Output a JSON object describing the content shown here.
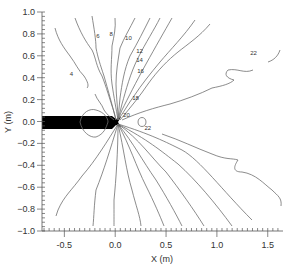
{
  "chart_data": {
    "type": "contour",
    "title": "",
    "xlabel": "X (m)",
    "ylabel": "Y (m)",
    "xlim": [
      -0.72,
      1.65
    ],
    "ylim": [
      -1.0,
      1.0
    ],
    "x_ticks": [
      -0.5,
      0.0,
      0.5,
      1.0,
      1.5
    ],
    "x_tick_labels": [
      "-0.5",
      "0.0",
      "0.5",
      "1.0",
      "1.5"
    ],
    "y_ticks": [
      1.0,
      0.8,
      0.6,
      0.4,
      0.2,
      0.0,
      -0.2,
      -0.4,
      -0.6,
      -0.8,
      -1.0
    ],
    "y_tick_labels": [
      "1.0",
      "0.8",
      "0.6",
      "0.4",
      "0.2",
      "0.0",
      "−0.2",
      "−0.4",
      "−0.6",
      "−0.8",
      "−1.0"
    ],
    "grid": false,
    "legend": "none",
    "contour_levels": [
      4,
      6,
      8,
      10,
      12,
      14,
      16,
      18,
      20,
      22
    ],
    "contour_labels": [
      {
        "text": "4",
        "x": -0.43,
        "y": 0.42
      },
      {
        "text": "6",
        "x": -0.17,
        "y": 0.76
      },
      {
        "text": "8",
        "x": -0.04,
        "y": 0.78
      },
      {
        "text": "10",
        "x": 0.13,
        "y": 0.74
      },
      {
        "text": "12",
        "x": 0.24,
        "y": 0.63
      },
      {
        "text": "14",
        "x": 0.24,
        "y": 0.54
      },
      {
        "text": "16",
        "x": 0.25,
        "y": 0.44
      },
      {
        "text": "18",
        "x": 0.2,
        "y": 0.2
      },
      {
        "text": "20",
        "x": 0.11,
        "y": 0.04
      },
      {
        "text": "22",
        "x": 0.32,
        "y": -0.08
      },
      {
        "text": "22",
        "x": 1.36,
        "y": 0.61
      }
    ],
    "probe": {
      "x_start": -0.72,
      "x_end": 0.0,
      "y_half_width": 0.055,
      "color": "#000000"
    }
  },
  "plot_area": {
    "left": 42,
    "right": 283,
    "top": 12,
    "bottom": 231
  },
  "contours_px": [
    {
      "level": "4a",
      "d": "M55,28 C58,40 64,48 70,56 C76,64 78,70 84,76 C88,82 89,86 87,88"
    },
    {
      "level": "4b",
      "d": "M95,94 C97,100 102,104 104,110 C108,116 112,118 114,120"
    },
    {
      "level": "6",
      "d": "M75,18 C80,32 86,42 92,50 C96,58 96,66 102,76 C106,86 110,100 114,112 L116,120"
    },
    {
      "level": "8",
      "d": "M92,16 C94,28 96,40 96,48 C98,58 100,64 104,76 C108,90 112,104 116,120"
    },
    {
      "level": "10",
      "d": "M115,18 C116,28 114,36 112,46 C112,58 110,70 112,84 C114,98 116,108 118,120"
    },
    {
      "level": "12",
      "d": "M135,18 C130,28 124,38 120,48 C118,60 116,72 116,84 C116,96 118,108 118,120"
    },
    {
      "level": "12b",
      "d": "M150,18 C144,30 138,42 130,56 C124,70 122,84 120,98 L118,120"
    },
    {
      "level": "14",
      "d": "M160,18 C154,30 146,42 138,58 C130,74 126,90 122,104 L118,120"
    },
    {
      "level": "16",
      "d": "M172,18 C164,32 156,46 146,64 C136,82 128,98 122,110 L118,120"
    },
    {
      "level": "18",
      "d": "M195,20 C184,36 170,50 160,62 C150,74 142,84 134,96 C128,104 124,112 118,120"
    },
    {
      "level": "20",
      "d": "M210,24 C200,36 188,44 178,52 C168,60 158,70 148,84 C140,96 130,108 120,120"
    },
    {
      "level": "22a",
      "d": "M253,70 C244,74 238,68 228,70 C224,74 226,78 234,80 C230,84 222,86 212,88 C200,94 184,100 170,104 C154,108 140,112 122,120"
    },
    {
      "level": "22b",
      "d": "M280,50 C278,56 274,60 268,62"
    },
    {
      "level": "b1",
      "d": "M118,124 C108,140 96,160 82,176 C72,190 64,196 58,210 L56,216"
    },
    {
      "level": "b2",
      "d": "M118,124 C110,150 104,170 96,190 C94,206 94,216 93,226"
    },
    {
      "level": "b3",
      "d": "M118,124 C118,150 116,180 114,200 C114,214 114,222 114,226"
    },
    {
      "level": "b4",
      "d": "M118,124 C124,150 126,170 132,190 C136,206 140,216 141,226"
    },
    {
      "level": "b5",
      "d": "M118,124 C130,146 136,166 146,186 C154,202 160,216 164,226"
    },
    {
      "level": "b6",
      "d": "M118,124 C134,144 142,160 156,180 C166,196 176,214 182,226"
    },
    {
      "level": "b7",
      "d": "M118,124 C140,140 150,156 166,172 C180,190 194,210 204,226"
    },
    {
      "level": "b8",
      "d": "M118,124 C148,140 160,150 178,164 C196,180 216,204 232,226"
    },
    {
      "level": "b9",
      "d": "M118,124 C150,134 166,142 182,150 C200,160 222,190 252,220"
    },
    {
      "level": "b10",
      "d": "M162,134 C180,140 196,148 212,154 C226,160 232,158 238,160 C234,166 232,172 242,172 C256,174 264,184 272,190 C278,196 282,198 281,206"
    },
    {
      "level": "loop-upper",
      "d": "M80,122 C82,112 90,108 96,110 C104,112 108,118 108,122"
    },
    {
      "level": "loop-lower",
      "d": "M80,122 C82,132 90,138 96,137 C104,134 106,128 108,122"
    },
    {
      "level": "loop-tip",
      "d": "M138,122 C138,116 146,116 146,122 C146,128 138,128 138,122"
    }
  ]
}
